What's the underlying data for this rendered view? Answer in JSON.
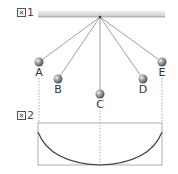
{
  "figure1": {
    "label_num": "1",
    "ceiling": {
      "x1": 38,
      "x2": 165,
      "y": 11,
      "height": 6,
      "color": "#d8d8d8"
    },
    "pivot": {
      "x": 100,
      "y": 17
    },
    "balls": [
      {
        "id": "A",
        "label": "A",
        "cx": 39,
        "cy": 62,
        "label_x": 33,
        "label_y": 67
      },
      {
        "id": "B",
        "label": "B",
        "cx": 58,
        "cy": 79,
        "label_x": 52,
        "label_y": 84
      },
      {
        "id": "C",
        "label": "C",
        "cx": 100,
        "cy": 94,
        "label_x": 94,
        "label_y": 99
      },
      {
        "id": "D",
        "label": "D",
        "cx": 143,
        "cy": 79,
        "label_x": 137,
        "label_y": 84
      },
      {
        "id": "E",
        "label": "E",
        "cx": 162,
        "cy": 62,
        "label_x": 156,
        "label_y": 67
      }
    ]
  },
  "figure2": {
    "label_num": "2",
    "box": {
      "x": 38,
      "y": 123,
      "width": 124,
      "height": 42
    },
    "curve": {
      "start": [
        38,
        132
      ],
      "bottom": [
        100,
        165
      ],
      "end": [
        162,
        132
      ]
    }
  },
  "colors": {
    "string": "#777777",
    "ball": "#888888",
    "dashed": "#999999",
    "curve": "#444444",
    "box": "#999999"
  }
}
